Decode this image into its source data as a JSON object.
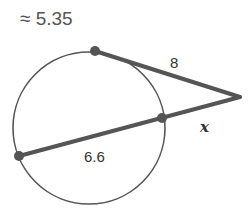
{
  "answer": {
    "text": "≈ 5.35"
  },
  "diagram": {
    "tangent_label": "8",
    "external_secant_label": "x",
    "internal_chord_label": "6.6",
    "colors": {
      "stroke": "#555555",
      "label": "#333333"
    }
  }
}
